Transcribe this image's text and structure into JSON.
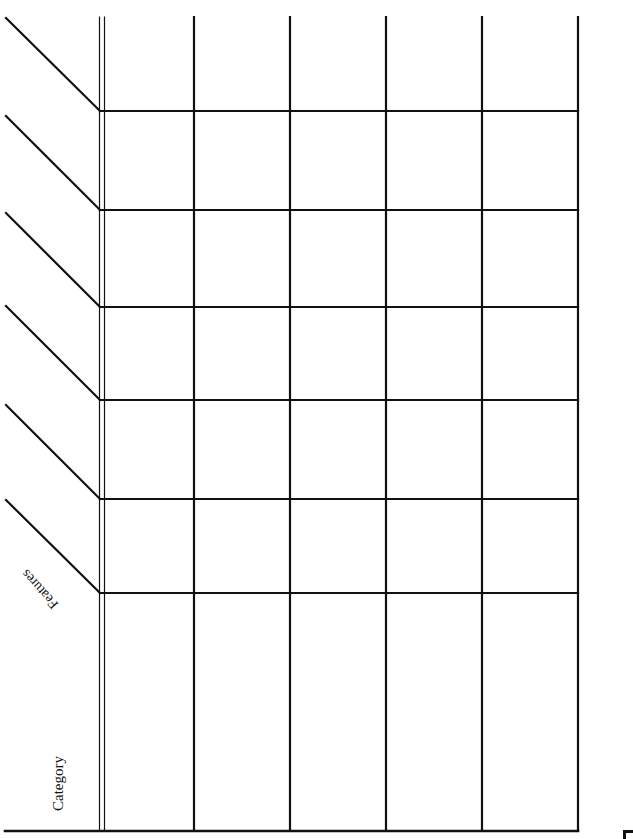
{
  "document": {
    "type": "blank comparison table template (rotated)",
    "header_labels": {
      "features": "Features",
      "category": "Category"
    },
    "table": {
      "columns": 5,
      "diagonal_header_rows": 6,
      "column_headers": [
        "",
        "",
        "",
        "",
        ""
      ],
      "row_headers": [
        "",
        "",
        "",
        "",
        "",
        ""
      ],
      "cells": [
        [
          "",
          "",
          "",
          "",
          ""
        ],
        [
          "",
          "",
          "",
          "",
          ""
        ],
        [
          "",
          "",
          "",
          "",
          ""
        ],
        [
          "",
          "",
          "",
          "",
          ""
        ],
        [
          "",
          "",
          "",
          "",
          ""
        ],
        [
          "",
          "",
          "",
          "",
          ""
        ],
        [
          "",
          "",
          "",
          "",
          ""
        ]
      ]
    },
    "colors": {
      "line": "#111111",
      "background": "#ffffff"
    }
  }
}
